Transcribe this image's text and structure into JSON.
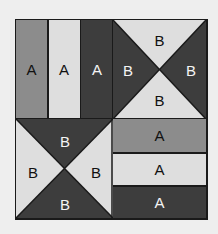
{
  "diagram": {
    "type": "quilt-block",
    "colors": {
      "medium": "#8c8c8c",
      "light": "#dedede",
      "dark": "#3d3d3d",
      "outline": "#1a1a1a",
      "background": "#eeeeee"
    },
    "blocks": {
      "top_left": {
        "kind": "vertical-strips",
        "strips": [
          {
            "label": "A",
            "shade": "medium"
          },
          {
            "label": "A",
            "shade": "light"
          },
          {
            "label": "A",
            "shade": "dark"
          }
        ]
      },
      "top_right": {
        "kind": "hourglass",
        "triangles": {
          "top": {
            "label": "B",
            "shade": "light"
          },
          "right": {
            "label": "B",
            "shade": "dark"
          },
          "bottom": {
            "label": "B",
            "shade": "light"
          },
          "left": {
            "label": "B",
            "shade": "dark"
          }
        }
      },
      "bottom_left": {
        "kind": "hourglass",
        "triangles": {
          "top": {
            "label": "B",
            "shade": "dark"
          },
          "right": {
            "label": "B",
            "shade": "light"
          },
          "bottom": {
            "label": "B",
            "shade": "dark"
          },
          "left": {
            "label": "B",
            "shade": "light"
          }
        }
      },
      "bottom_right": {
        "kind": "horizontal-strips",
        "strips": [
          {
            "label": "A",
            "shade": "medium"
          },
          {
            "label": "A",
            "shade": "light"
          },
          {
            "label": "A",
            "shade": "dark"
          }
        ]
      }
    }
  }
}
